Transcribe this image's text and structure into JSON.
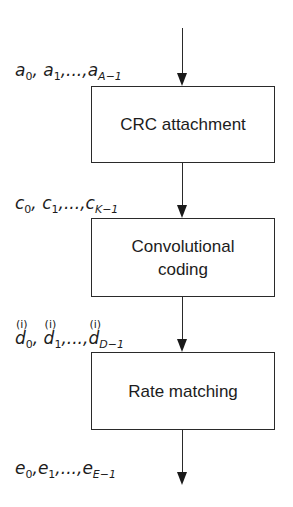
{
  "diagram": {
    "type": "vertical-flowchart",
    "blocks": [
      {
        "id": "crc",
        "label_lines": [
          "CRC attachment"
        ]
      },
      {
        "id": "conv",
        "label_lines": [
          "Convolutional",
          "coding"
        ]
      },
      {
        "id": "rate",
        "label_lines": [
          "Rate matching"
        ]
      }
    ],
    "signals": [
      {
        "id": "input",
        "symbol": "a",
        "first": "0",
        "second": "1",
        "last_sub": "A−1",
        "sep": ",",
        "ellipsis": "...",
        "text": "a0, a1,...,aA−1"
      },
      {
        "id": "after_crc",
        "symbol": "c",
        "first": "0",
        "second": "1",
        "last_sub": "K−1",
        "sep": ",",
        "ellipsis": "...",
        "text": "c0, c1,...,cK−1"
      },
      {
        "id": "after_conv",
        "symbol": "d",
        "superscript": "(i)",
        "first": "0",
        "second": "1",
        "last_sub": "D−1",
        "sep": ",",
        "ellipsis": "...",
        "text": "d0(i), d1(i),...,dD−1(i)"
      },
      {
        "id": "output",
        "symbol": "e",
        "first": "0",
        "second": "1",
        "last_sub": "E−1",
        "sep": ",",
        "ellipsis": "...",
        "text": "e0, e1,...,eE−1"
      }
    ],
    "colors": {
      "line": "#2a2a2a",
      "text": "#1c1c1c",
      "background": "#ffffff"
    }
  }
}
